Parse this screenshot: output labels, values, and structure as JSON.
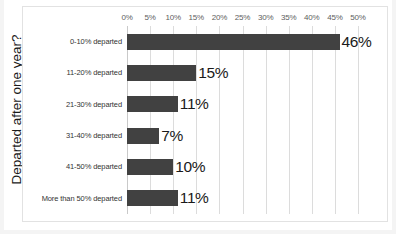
{
  "chart_data": {
    "type": "bar",
    "orientation": "horizontal",
    "title": "",
    "xlabel": "",
    "ylabel": "Departed after one year?",
    "xlim": [
      0,
      50
    ],
    "grid": true,
    "legend": "none",
    "categories": [
      "0-10% departed",
      "11-20% departed",
      "21-30% departed",
      "31-40% departed",
      "41-50% departed",
      "More than 50% departed"
    ],
    "values": [
      46,
      15,
      11,
      7,
      10,
      11
    ],
    "data_labels": [
      "46%",
      "15%",
      "11%",
      "7%",
      "10%",
      "11%"
    ],
    "tick_values": [
      0,
      5,
      10,
      15,
      20,
      25,
      30,
      35,
      40,
      45,
      50
    ],
    "tick_labels": [
      "0%",
      "5%",
      "10%",
      "15%",
      "20%",
      "25%",
      "30%",
      "35%",
      "40%",
      "45%",
      "50%"
    ],
    "tick_position": "top",
    "colors": {
      "bar": "#414141",
      "gridline": "#dcdcdc",
      "axis_line": "#c9c9c9",
      "frame": "#e2e2e2",
      "background": "#ffffff",
      "tick_label": "#5e5e5e",
      "category_label": "#333333",
      "data_label": "#1a1a1a"
    }
  }
}
